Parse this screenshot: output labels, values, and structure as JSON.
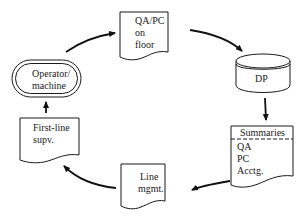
{
  "diagram": {
    "type": "cyclic flow diagram",
    "nodes": [
      {
        "id": "operator",
        "shape": "terminal (double-outline)",
        "lines": [
          "Operator/",
          "machine"
        ]
      },
      {
        "id": "qapc",
        "shape": "document",
        "lines": [
          "QA/PC",
          "on",
          "floor"
        ]
      },
      {
        "id": "dp",
        "shape": "cylinder / storage",
        "lines": [
          "DP"
        ]
      },
      {
        "id": "summaries",
        "shape": "document",
        "header": "Summaries",
        "lines": [
          "QA",
          "PC",
          "Acctg."
        ]
      },
      {
        "id": "linemgmt",
        "shape": "document",
        "lines": [
          "Line",
          "mgmt."
        ]
      },
      {
        "id": "firstline",
        "shape": "document",
        "lines": [
          "First-line",
          "supv."
        ]
      }
    ],
    "edges": [
      {
        "from": "operator",
        "to": "qapc"
      },
      {
        "from": "qapc",
        "to": "dp"
      },
      {
        "from": "dp",
        "to": "summaries"
      },
      {
        "from": "summaries",
        "to": "linemgmt"
      },
      {
        "from": "linemgmt",
        "to": "firstline"
      },
      {
        "from": "firstline",
        "to": "operator"
      }
    ]
  },
  "colors": {
    "stroke": "#1a1a1a",
    "background": "#ffffff"
  }
}
